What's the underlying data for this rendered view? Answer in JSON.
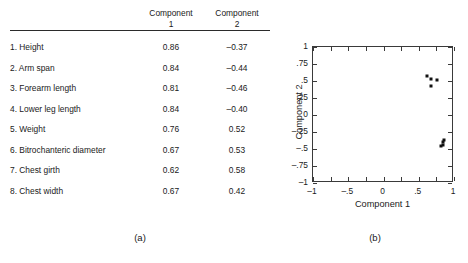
{
  "figure": {
    "panel_a_label": "(a)",
    "panel_b_label": "(b)"
  },
  "table": {
    "header_blank": "",
    "header_component_1_line1": "Component",
    "header_component_1_line2": "1",
    "header_component_2_line1": "Component",
    "header_component_2_line2": "2",
    "rows": [
      {
        "variable": "1. Height",
        "c1": "0.86",
        "c2": "–0.37"
      },
      {
        "variable": "2. Arm span",
        "c1": "0.84",
        "c2": "–0.44"
      },
      {
        "variable": "3. Forearm length",
        "c1": "0.81",
        "c2": "–0.46"
      },
      {
        "variable": "4. Lower leg length",
        "c1": "0.84",
        "c2": "–0.40"
      },
      {
        "variable": "5. Weight",
        "c1": "0.76",
        "c2": "0.52"
      },
      {
        "variable": "6. Bitrochanteric diameter",
        "c1": "0.67",
        "c2": "0.53"
      },
      {
        "variable": "7. Chest girth",
        "c1": "0.62",
        "c2": "0.58"
      },
      {
        "variable": "8. Chest width",
        "c1": "0.67",
        "c2": "0.42"
      }
    ]
  },
  "chart_data": {
    "type": "scatter",
    "title": "",
    "xlabel": "Component 1",
    "ylabel": "Component 2",
    "xlim": [
      -1,
      1
    ],
    "ylim": [
      -1,
      1
    ],
    "grid": false,
    "legend": "none",
    "xticks": [
      -1,
      -0.5,
      0,
      0.5,
      1
    ],
    "xtick_labels": [
      "–1",
      "–.5",
      "0",
      ".5",
      "1"
    ],
    "yticks": [
      -1,
      -0.75,
      -0.5,
      -0.25,
      0,
      0.25,
      0.5,
      0.75,
      1
    ],
    "ytick_labels": [
      "–1",
      "–.75",
      "–.5",
      "–.25",
      "0",
      ".25",
      ".5",
      ".75",
      "1"
    ],
    "minor_xticks": [
      -0.75,
      -0.25,
      0.25,
      0.75
    ],
    "points": [
      {
        "label": "1. Height",
        "x": 0.86,
        "y": -0.37
      },
      {
        "label": "2. Arm span",
        "x": 0.84,
        "y": -0.44
      },
      {
        "label": "3. Forearm length",
        "x": 0.81,
        "y": -0.46
      },
      {
        "label": "4. Lower leg length",
        "x": 0.84,
        "y": -0.4
      },
      {
        "label": "5. Weight",
        "x": 0.76,
        "y": 0.52
      },
      {
        "label": "6. Bitrochanteric diameter",
        "x": 0.67,
        "y": 0.53
      },
      {
        "label": "7. Chest girth",
        "x": 0.62,
        "y": 0.58
      },
      {
        "label": "8. Chest width",
        "x": 0.67,
        "y": 0.42
      }
    ]
  }
}
